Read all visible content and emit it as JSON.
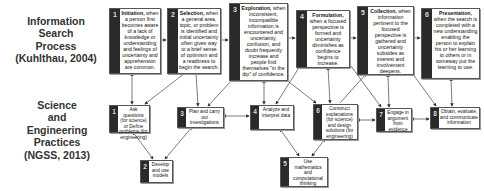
{
  "labels": {
    "top": [
      "Information",
      "Search",
      "Process",
      "(Kuhlthau, 2004)"
    ],
    "bottom": [
      "Science",
      "and",
      "Engineering",
      "Practices",
      "(NGSS, 2013)"
    ]
  },
  "isp_stages": [
    {
      "num": "1",
      "title": "Initiation,",
      "text": "when a person first becomes aware of a lack of knowledge or understanding and feelings of uncertainty and apprehension are common."
    },
    {
      "num": "2",
      "title": "Selection,",
      "text": "when a general area, topic, or problem is identified and initial uncertainty often gives way to a brief sense of optimism and a readiness to begin the search."
    },
    {
      "num": "3",
      "title": "Exploration,",
      "text": "when inconsistent, incompatible information is encountered and uncertainty, confusion, and doubt frequently increase and people find themselves \"in the dip\" of confidence."
    },
    {
      "num": "4",
      "title": "Formulation,",
      "text": "when a focused perspective is formed and uncertainty diminishes as confidence begins to increase."
    },
    {
      "num": "5",
      "title": "Collection,",
      "text": "when information pertinent to the focused perspective is gathered and uncertainty subsides as interest and involvement deepens."
    },
    {
      "num": "6",
      "title": "Presentation,",
      "text": "when the search is completed with a new understanding enabling the person to explain his or her learning to others or in someway put the learning to use."
    }
  ],
  "practices": [
    {
      "num": "1",
      "text": "Ask questions (for science) or Define problems (for engineering)"
    },
    {
      "num": "2",
      "text": "Develop and use models"
    },
    {
      "num": "3",
      "text": "Plan and carry out investigations"
    },
    {
      "num": "4",
      "text": "Analyze and interpret data"
    },
    {
      "num": "5",
      "text": "Use mathematics and computational thinking"
    },
    {
      "num": "6",
      "text": "Construct explanations (for science) and design solutions (for engineering)"
    },
    {
      "num": "7",
      "text": "Engage in argument from evidence"
    },
    {
      "num": "8",
      "text": "Obtain, evaluate, and communicate information"
    }
  ]
}
